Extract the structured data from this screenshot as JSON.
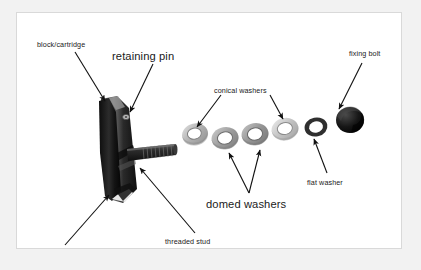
{
  "figure": {
    "kind": "exploded-parts-diagram",
    "background": "#ffffff",
    "border_color": "#d9d9d9",
    "page_background": "#f2f2f2",
    "text_color": "#1a1a1a"
  },
  "labels": [
    {
      "id": "block-cartridge",
      "text": "block/cartridge",
      "size": "sm",
      "x": 20,
      "y": 28
    },
    {
      "id": "retaining-pin",
      "text": "retaining pin",
      "size": "lg",
      "x": 95,
      "y": 38
    },
    {
      "id": "conical-washers",
      "text": "conical washers",
      "size": "sm",
      "x": 197,
      "y": 74
    },
    {
      "id": "fixing-bolt",
      "text": "fixing bolt",
      "size": "sm",
      "x": 350,
      "y": 37
    },
    {
      "id": "flat-washer",
      "text": "flat washer",
      "size": "sm",
      "x": 304,
      "y": 170
    },
    {
      "id": "domed-washers",
      "text": "domed washers",
      "size": "lg",
      "x": 205,
      "y": 189
    },
    {
      "id": "threaded-stud",
      "text": "threaded stud",
      "size": "sm",
      "x": 162,
      "y": 229
    },
    {
      "id": "cartridge-pad",
      "text": "cartridge pad",
      "size": "sm",
      "x": 34,
      "y": 240
    }
  ],
  "parts": [
    {
      "id": "brake-block",
      "name": "block/cartridge body",
      "color": "#2a2a2a"
    },
    {
      "id": "cartridge-pad",
      "name": "cartridge pad",
      "color": "#1c1c1c"
    },
    {
      "id": "retaining-pin",
      "name": "retaining pin",
      "color": "#9a9a9a"
    },
    {
      "id": "threaded-stud",
      "name": "threaded stud",
      "color": "#2e2e2e"
    },
    {
      "id": "washer-1",
      "name": "conical washer",
      "color": "#bdbdbd"
    },
    {
      "id": "washer-2",
      "name": "domed washer",
      "color": "#a8a8a8"
    },
    {
      "id": "washer-3",
      "name": "domed washer",
      "color": "#9e9e9e"
    },
    {
      "id": "washer-4",
      "name": "conical washer",
      "color": "#cfcfcf"
    },
    {
      "id": "flat-washer",
      "name": "flat washer",
      "color": "#3a3a3a"
    },
    {
      "id": "fixing-bolt",
      "name": "fixing bolt",
      "color": "#141414"
    }
  ],
  "arrows": [
    {
      "id": "arrow-block-cartridge",
      "from": "block/cartridge",
      "to": "brake-block"
    },
    {
      "id": "arrow-retaining-pin",
      "from": "retaining pin",
      "to": "retaining-pin"
    },
    {
      "id": "arrow-conical-left",
      "from": "conical washers",
      "to": "washer-1"
    },
    {
      "id": "arrow-conical-right",
      "from": "conical washers",
      "to": "washer-4"
    },
    {
      "id": "arrow-fixing-bolt",
      "from": "fixing bolt",
      "to": "fixing-bolt"
    },
    {
      "id": "arrow-flat-washer",
      "from": "flat washer",
      "to": "flat-washer"
    },
    {
      "id": "arrow-domed-left",
      "from": "domed washers",
      "to": "washer-2"
    },
    {
      "id": "arrow-domed-right",
      "from": "domed washers",
      "to": "washer-3"
    },
    {
      "id": "arrow-threaded-stud",
      "from": "threaded stud",
      "to": "threaded-stud"
    },
    {
      "id": "arrow-cartridge-pad",
      "from": "cartridge pad",
      "to": "cartridge-pad"
    }
  ]
}
